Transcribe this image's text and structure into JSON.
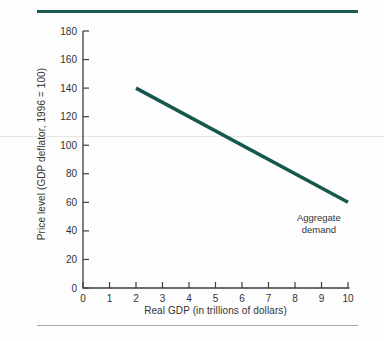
{
  "decor": {
    "top_rule_color": "#1b5c52",
    "bottom_rule_color": "#9cada9",
    "faint_line_color": "#d9dcdb"
  },
  "chart_data": {
    "type": "line",
    "title": "",
    "xlabel": "Real GDP (in trillions of dollars)",
    "ylabel": "Price level (GDP deflator, 1996 = 100)",
    "xlim": [
      0,
      10
    ],
    "ylim": [
      0,
      180
    ],
    "xticks": [
      0,
      1,
      2,
      3,
      4,
      5,
      6,
      7,
      8,
      9,
      10
    ],
    "yticks": [
      0,
      20,
      40,
      60,
      80,
      100,
      120,
      140,
      160,
      180
    ],
    "grid": false,
    "legend": "none",
    "axis_color": "#3e3e3e",
    "text_color": "#333333",
    "series": [
      {
        "name": "Aggregate demand",
        "x": [
          2,
          10
        ],
        "y": [
          140,
          60
        ],
        "color": "#16584e",
        "stroke_width": 3.5
      }
    ],
    "annotations": [
      {
        "lines": [
          "Aggregate",
          "demand"
        ],
        "x": 8.9,
        "y": 47,
        "color": "#333333"
      }
    ]
  }
}
